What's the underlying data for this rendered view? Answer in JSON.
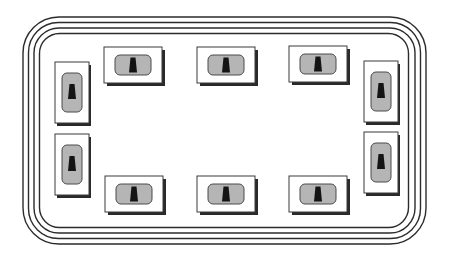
{
  "diagram": {
    "type": "switch-panel-layout",
    "border_rings": 4,
    "colors": {
      "background": "#ffffff",
      "ring_stroke": "#2b2b2b",
      "unit_fill": "#ffffff",
      "unit_stroke": "#3a3a3a",
      "unit_shadow": "#2a2a2a",
      "pill_fill": "#b5b5b5",
      "pill_stroke": "#4a4a4a",
      "key_fill": "#141414"
    },
    "units": [
      {
        "id": "top-1",
        "side": "top",
        "orientation": "horizontal"
      },
      {
        "id": "top-2",
        "side": "top",
        "orientation": "horizontal"
      },
      {
        "id": "top-3",
        "side": "top",
        "orientation": "horizontal"
      },
      {
        "id": "bottom-1",
        "side": "bottom",
        "orientation": "horizontal"
      },
      {
        "id": "bottom-2",
        "side": "bottom",
        "orientation": "horizontal"
      },
      {
        "id": "bottom-3",
        "side": "bottom",
        "orientation": "horizontal"
      },
      {
        "id": "left-1",
        "side": "left",
        "orientation": "vertical"
      },
      {
        "id": "left-2",
        "side": "left",
        "orientation": "vertical"
      },
      {
        "id": "right-1",
        "side": "right",
        "orientation": "vertical"
      },
      {
        "id": "right-2",
        "side": "right",
        "orientation": "vertical"
      }
    ],
    "unit_count": 10
  }
}
